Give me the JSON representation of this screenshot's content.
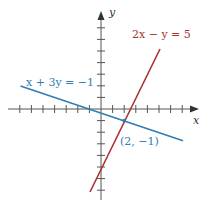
{
  "diagram": {
    "type": "coordinate-plane-linear-system",
    "axes": {
      "x_label": "x",
      "y_label": "y",
      "x_ticks": [
        -7,
        -6,
        -5,
        -4,
        -3,
        -2,
        -1,
        1,
        2,
        3,
        4,
        5,
        6,
        7
      ],
      "y_ticks": [
        -7,
        -6,
        -5,
        -4,
        -3,
        -2,
        -1,
        1,
        2,
        3,
        4,
        5,
        6,
        7
      ],
      "origin_px": [
        101,
        109
      ],
      "unit_px": 11.6
    },
    "lines": [
      {
        "equation": "x + 3y = −1",
        "color": "#2f7db3",
        "x_range": [
          -7,
          7
        ]
      },
      {
        "equation": "2x − y = 5",
        "color": "#a8322f",
        "x_range": [
          -1,
          5
        ]
      }
    ],
    "intersection": {
      "label": "(2, −1)",
      "x": 2,
      "y": -1
    }
  },
  "labels": {
    "x_axis": "x",
    "y_axis": "y",
    "line1": "x + 3y = −1",
    "line2": "2x − y = 5",
    "point": "(2, −1)"
  }
}
